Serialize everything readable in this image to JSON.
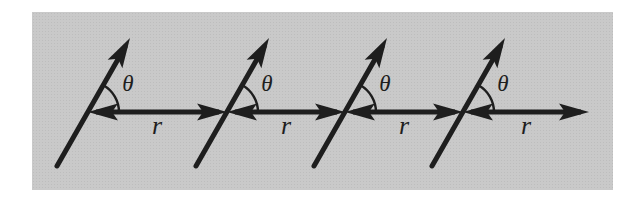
{
  "figure": {
    "colors": {
      "page": "#ffffff",
      "panel": "#c9c9c9",
      "ink": "#1e1e1e"
    },
    "units": [
      {
        "angle_label": "θ",
        "separation_label": "r"
      },
      {
        "angle_label": "θ",
        "separation_label": "r"
      },
      {
        "angle_label": "θ",
        "separation_label": "r"
      },
      {
        "angle_label": "θ",
        "separation_label": "r"
      }
    ]
  }
}
